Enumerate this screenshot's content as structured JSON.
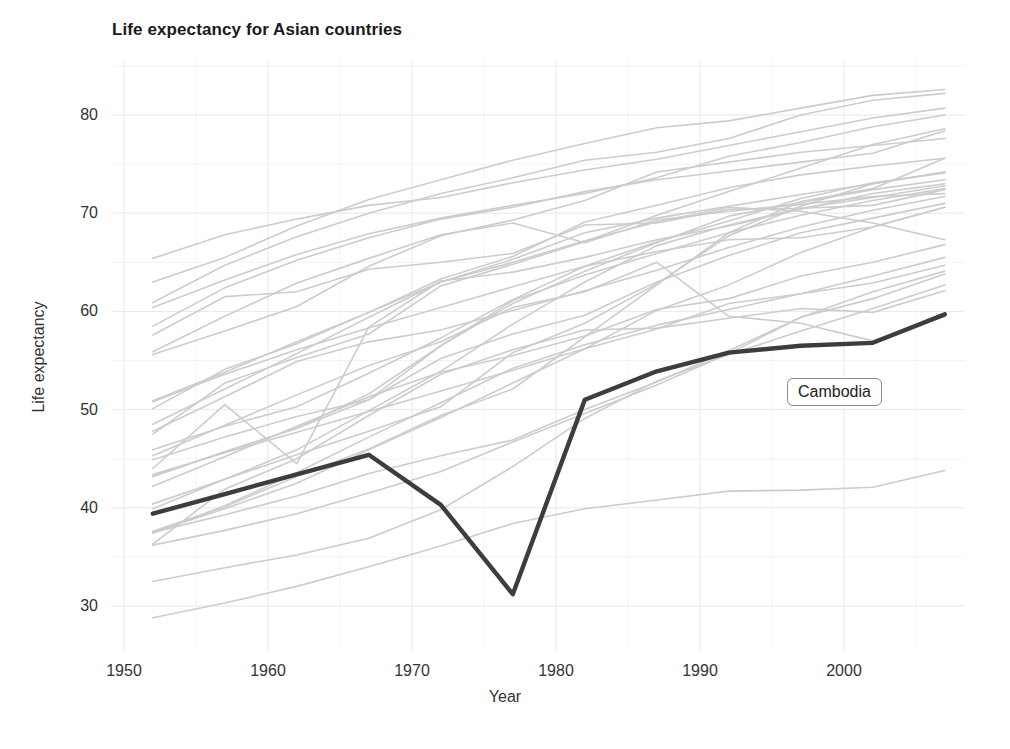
{
  "chart_data": {
    "type": "line",
    "title": "Life expectancy for Asian countries",
    "xlabel": "Year",
    "ylabel": "Life expectancy",
    "xlim": [
      1947,
      2010
    ],
    "ylim": [
      28,
      84
    ],
    "x_ticks": [
      "1950",
      "1960",
      "1970",
      "1980",
      "1990",
      "2000"
    ],
    "x_tick_values": [
      1950,
      1960,
      1970,
      1980,
      1990,
      2000
    ],
    "y_ticks": [
      "30",
      "40",
      "50",
      "60",
      "70",
      "80"
    ],
    "y_tick_values": [
      30,
      40,
      50,
      60,
      70,
      80
    ],
    "grid": true,
    "legend": "none",
    "x": [
      1952,
      1957,
      1962,
      1967,
      1972,
      1977,
      1982,
      1987,
      1992,
      1997,
      2002,
      2007
    ],
    "highlight_color": "#3d3d3d",
    "background_series_color": "#cccccc",
    "annotations": [
      {
        "text": "Cambodia",
        "x": 1996.5,
        "y": 52.0,
        "style": "rounded-box-label"
      }
    ],
    "highlight_series": {
      "name": "Cambodia",
      "values": [
        39.4,
        41.4,
        43.4,
        45.4,
        40.3,
        31.2,
        51.0,
        53.9,
        55.8,
        56.5,
        56.8,
        59.7
      ]
    },
    "series": [
      {
        "name": "Afghanistan",
        "values": [
          28.8,
          30.3,
          32.0,
          34.0,
          36.1,
          38.4,
          39.9,
          40.8,
          41.7,
          41.8,
          42.1,
          43.8
        ]
      },
      {
        "name": "Bahrain",
        "values": [
          50.9,
          53.8,
          56.9,
          59.9,
          63.3,
          65.6,
          69.1,
          70.8,
          72.6,
          73.9,
          74.8,
          75.6
        ]
      },
      {
        "name": "Bangladesh",
        "values": [
          37.5,
          39.3,
          41.2,
          43.5,
          45.3,
          46.9,
          50.0,
          52.8,
          56.0,
          59.4,
          62.0,
          64.1
        ]
      },
      {
        "name": "China",
        "values": [
          44.0,
          50.5,
          44.5,
          58.4,
          63.1,
          64.0,
          65.5,
          67.3,
          68.7,
          70.4,
          72.0,
          73.0
        ]
      },
      {
        "name": "Hong Kong, China",
        "values": [
          60.9,
          64.7,
          67.6,
          70.0,
          72.0,
          73.6,
          75.4,
          76.2,
          77.6,
          80.0,
          81.5,
          82.2
        ]
      },
      {
        "name": "India",
        "values": [
          37.4,
          40.2,
          43.6,
          47.2,
          50.7,
          54.2,
          56.6,
          58.6,
          60.2,
          61.8,
          62.9,
          64.7
        ]
      },
      {
        "name": "Indonesia",
        "values": [
          37.5,
          39.9,
          42.5,
          45.9,
          49.2,
          52.7,
          56.2,
          60.1,
          62.7,
          66.0,
          68.6,
          70.6
        ]
      },
      {
        "name": "Iran",
        "values": [
          44.9,
          47.2,
          49.3,
          51.0,
          55.2,
          57.7,
          59.6,
          63.0,
          65.7,
          68.0,
          69.5,
          71.0
        ]
      },
      {
        "name": "Iraq",
        "values": [
          45.3,
          48.4,
          51.5,
          54.5,
          56.9,
          60.4,
          62.0,
          65.0,
          59.5,
          58.8,
          57.0,
          59.5
        ]
      },
      {
        "name": "Israel",
        "values": [
          65.4,
          67.8,
          69.4,
          70.8,
          71.6,
          73.1,
          74.4,
          75.5,
          76.9,
          78.3,
          79.7,
          80.7
        ]
      },
      {
        "name": "Japan",
        "values": [
          63.0,
          65.5,
          68.7,
          71.4,
          73.4,
          75.4,
          77.1,
          78.7,
          79.4,
          80.7,
          82.0,
          82.6
        ]
      },
      {
        "name": "Jordan",
        "values": [
          43.2,
          45.7,
          48.1,
          51.6,
          56.5,
          61.1,
          63.7,
          65.9,
          68.0,
          69.8,
          71.3,
          72.5
        ]
      },
      {
        "name": "Korea, Dem. Rep.",
        "values": [
          50.1,
          54.1,
          56.7,
          59.9,
          63.0,
          65.0,
          67.2,
          69.1,
          70.6,
          70.2,
          69.0,
          67.3
        ]
      },
      {
        "name": "Korea, Rep.",
        "values": [
          47.5,
          52.7,
          55.3,
          57.7,
          62.6,
          64.8,
          67.1,
          69.8,
          72.2,
          74.6,
          77.0,
          78.6
        ]
      },
      {
        "name": "Kuwait",
        "values": [
          55.6,
          58.0,
          60.5,
          64.6,
          67.7,
          69.3,
          71.3,
          74.2,
          75.2,
          76.2,
          76.9,
          77.6
        ]
      },
      {
        "name": "Lebanon",
        "values": [
          55.9,
          59.5,
          62.9,
          65.4,
          67.8,
          69.0,
          67.0,
          69.3,
          70.2,
          70.9,
          71.7,
          71.99
        ]
      },
      {
        "name": "Malaysia",
        "values": [
          48.5,
          52.1,
          55.7,
          59.4,
          63.0,
          65.3,
          68.0,
          69.5,
          70.7,
          71.9,
          73.0,
          74.2
        ]
      },
      {
        "name": "Mongolia",
        "values": [
          42.2,
          45.2,
          48.3,
          51.3,
          53.8,
          55.5,
          57.5,
          60.2,
          61.3,
          63.6,
          65.0,
          66.8
        ]
      },
      {
        "name": "Myanmar",
        "values": [
          36.3,
          41.9,
          45.0,
          49.4,
          53.6,
          56.1,
          58.1,
          58.3,
          59.3,
          60.3,
          59.9,
          62.1
        ]
      },
      {
        "name": "Nepal",
        "values": [
          36.2,
          37.7,
          39.4,
          41.5,
          43.7,
          46.7,
          49.6,
          52.5,
          55.7,
          59.4,
          61.3,
          63.8
        ]
      },
      {
        "name": "Oman",
        "values": [
          37.6,
          40.1,
          43.2,
          46.0,
          49.4,
          52.1,
          57.4,
          62.7,
          68.0,
          71.2,
          72.5,
          75.6
        ]
      },
      {
        "name": "Pakistan",
        "values": [
          43.4,
          45.6,
          47.7,
          49.8,
          51.9,
          54.0,
          56.2,
          58.2,
          60.8,
          61.8,
          63.6,
          65.5
        ]
      },
      {
        "name": "Philippines",
        "values": [
          47.8,
          51.3,
          54.9,
          56.9,
          58.1,
          60.1,
          62.1,
          64.2,
          66.5,
          68.6,
          70.3,
          71.7
        ]
      },
      {
        "name": "Saudi Arabia",
        "values": [
          39.9,
          42.9,
          45.9,
          49.9,
          53.9,
          58.7,
          63.0,
          66.7,
          68.8,
          70.5,
          71.6,
          72.8
        ]
      },
      {
        "name": "Singapore",
        "values": [
          60.4,
          63.2,
          65.8,
          67.9,
          69.5,
          70.8,
          72.0,
          73.6,
          75.8,
          77.2,
          78.8,
          80.0
        ]
      },
      {
        "name": "Sri Lanka",
        "values": [
          57.6,
          61.5,
          62.0,
          64.3,
          65.0,
          65.9,
          68.8,
          69.0,
          70.4,
          70.5,
          70.8,
          72.4
        ]
      },
      {
        "name": "Syria",
        "values": [
          45.9,
          48.3,
          50.3,
          53.7,
          57.3,
          61.2,
          64.6,
          67.1,
          69.2,
          71.5,
          73.1,
          74.1
        ]
      },
      {
        "name": "Taiwan",
        "values": [
          58.5,
          62.4,
          65.2,
          67.5,
          69.4,
          70.6,
          72.2,
          73.4,
          74.3,
          75.2,
          76.1,
          78.4
        ]
      },
      {
        "name": "Thailand",
        "values": [
          50.8,
          53.6,
          56.1,
          58.3,
          60.4,
          62.5,
          64.6,
          66.1,
          67.3,
          67.5,
          68.6,
          70.6
        ]
      },
      {
        "name": "Vietnam",
        "values": [
          40.4,
          42.9,
          45.4,
          47.8,
          50.3,
          55.8,
          58.8,
          62.8,
          67.7,
          70.7,
          73.0,
          74.2
        ]
      },
      {
        "name": "West Bank and Gaza",
        "values": [
          43.2,
          45.7,
          48.1,
          51.0,
          56.5,
          60.8,
          64.1,
          67.0,
          69.7,
          71.1,
          72.4,
          73.4
        ]
      },
      {
        "name": "Yemen, Rep.",
        "values": [
          32.5,
          33.9,
          35.2,
          36.9,
          39.8,
          44.2,
          49.1,
          52.9,
          55.6,
          58.0,
          60.3,
          62.7
        ]
      }
    ]
  },
  "title": "Life expectancy for Asian countries",
  "axes": {
    "x_label": "Year",
    "y_label": "Life expectancy"
  },
  "labels": {
    "cambodia": "Cambodia"
  }
}
